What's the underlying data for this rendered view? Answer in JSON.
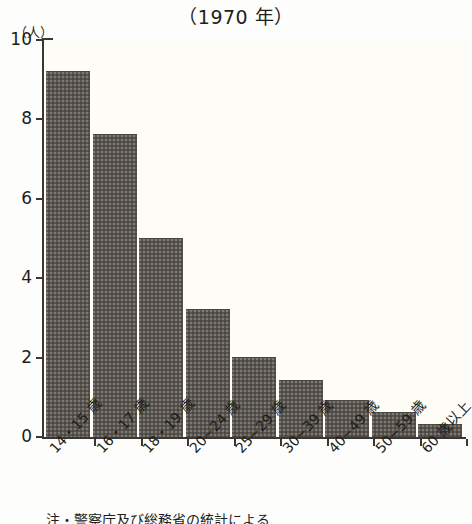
{
  "chart_data": {
    "type": "bar",
    "title": "（1970 年）",
    "xlabel": "",
    "ylabel": "（人）",
    "ylim": [
      0,
      10
    ],
    "yticks": [
      "0",
      "2",
      "4",
      "6",
      "8",
      "10"
    ],
    "grid": false,
    "legend": null,
    "categories": [
      "14・15 歳",
      "16・17 歳",
      "18・19 歳",
      "20~24 歳",
      "25~29 歳",
      "30~39 歳",
      "40~49 歳",
      "50~59 歳",
      "60 歳以上"
    ],
    "values": [
      9.2,
      7.6,
      5.0,
      3.2,
      2.0,
      1.4,
      0.9,
      0.6,
      0.3
    ],
    "bar_color": "#5a554f",
    "axis_color": "#3a3633",
    "background_color": "#fdfcf7"
  },
  "footnote": "注・警察庁及び総務省の統計による"
}
